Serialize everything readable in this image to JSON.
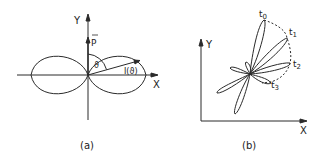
{
  "panel_a": {
    "caption": "(a)",
    "y_axis_label": "Y",
    "x_axis_label": "X",
    "vector_label": "P",
    "angle_label": "ϑ",
    "intensity_label": "I(ϑ)"
  },
  "panel_b": {
    "caption": "(b)",
    "y_axis_label": "Y",
    "x_axis_label": "X",
    "time_labels": [
      {
        "base": "t",
        "sub": "0"
      },
      {
        "base": "t",
        "sub": "1"
      },
      {
        "base": "t",
        "sub": "2"
      },
      {
        "base": "t",
        "sub": "3"
      }
    ]
  },
  "colors": {
    "stroke": "#2a2a2a",
    "background": "#ffffff"
  }
}
